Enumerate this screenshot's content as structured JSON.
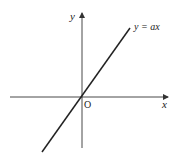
{
  "diagram": {
    "type": "coordinate-graph",
    "axes": {
      "x_label": "x",
      "y_label": "y",
      "origin_label": "O"
    },
    "line": {
      "equation_label": "y = ax",
      "description": "straight line through the origin with positive slope"
    },
    "colors": {
      "axis": "#333333",
      "line": "#222222",
      "background": "#ffffff"
    }
  }
}
